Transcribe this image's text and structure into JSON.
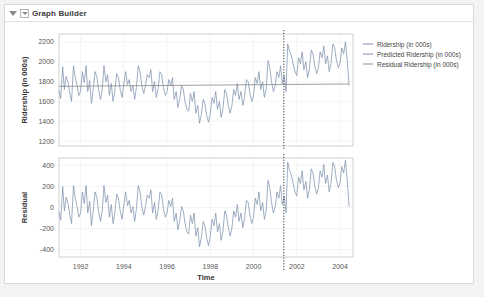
{
  "window": {
    "title": "Graph Builder",
    "collapse_icon": "triangle-down-icon",
    "menu_icon": "triangle-down-boxed-icon"
  },
  "legend": {
    "items": [
      {
        "label": "Ridership (in 000s)",
        "color": "#7f93ad"
      },
      {
        "label": "Predicted Ridership (in 000s)",
        "color": "#7f93ad"
      },
      {
        "label": "Residual Ridership (in 000s)",
        "color": "#7f93ad"
      }
    ]
  },
  "chart_data": {
    "type": "line",
    "title": "",
    "xlabel": "Time",
    "grid": true,
    "legend_position": "right",
    "xlim": [
      1991.0,
      2004.6
    ],
    "xticks": [
      1992,
      1994,
      1996,
      1998,
      2000,
      2002,
      2004
    ],
    "reference_line": {
      "x": 2001.4,
      "style": "dotted",
      "color": "#333333"
    },
    "panels": [
      {
        "name": "ridership-panel",
        "ylabel": "Ridership (in 000s)",
        "ylim": [
          1150,
          2280
        ],
        "yticks": [
          1200,
          1400,
          1600,
          1800,
          2000,
          2200
        ],
        "series": [
          {
            "name": "Ridership (in 000s)",
            "color": "#7f93ad",
            "x": [
              1991.0,
              1991.08,
              1991.17,
              1991.25,
              1991.33,
              1991.42,
              1991.5,
              1991.58,
              1991.67,
              1991.75,
              1991.83,
              1991.92,
              1992.0,
              1992.08,
              1992.17,
              1992.25,
              1992.33,
              1992.42,
              1992.5,
              1992.58,
              1992.67,
              1992.75,
              1992.83,
              1992.92,
              1993.0,
              1993.08,
              1993.17,
              1993.25,
              1993.33,
              1993.42,
              1993.5,
              1993.58,
              1993.67,
              1993.75,
              1993.83,
              1993.92,
              1994.0,
              1994.08,
              1994.17,
              1994.25,
              1994.33,
              1994.42,
              1994.5,
              1994.58,
              1994.67,
              1994.75,
              1994.83,
              1994.92,
              1995.0,
              1995.08,
              1995.17,
              1995.25,
              1995.33,
              1995.42,
              1995.5,
              1995.58,
              1995.67,
              1995.75,
              1995.83,
              1995.92,
              1996.0,
              1996.08,
              1996.17,
              1996.25,
              1996.33,
              1996.42,
              1996.5,
              1996.58,
              1996.67,
              1996.75,
              1996.83,
              1996.92,
              1997.0,
              1997.08,
              1997.17,
              1997.25,
              1997.33,
              1997.42,
              1997.5,
              1997.58,
              1997.67,
              1997.75,
              1997.83,
              1997.92,
              1998.0,
              1998.08,
              1998.17,
              1998.25,
              1998.33,
              1998.42,
              1998.5,
              1998.58,
              1998.67,
              1998.75,
              1998.83,
              1998.92,
              1999.0,
              1999.08,
              1999.17,
              1999.25,
              1999.33,
              1999.42,
              1999.5,
              1999.58,
              1999.67,
              1999.75,
              1999.83,
              1999.92,
              2000.0,
              2000.08,
              2000.17,
              2000.25,
              2000.33,
              2000.42,
              2000.5,
              2000.58,
              2000.67,
              2000.75,
              2000.83,
              2000.92,
              2001.0,
              2001.08,
              2001.17,
              2001.25,
              2001.33,
              2001.42,
              2001.5,
              2001.58,
              2001.67,
              2001.75,
              2001.83,
              2001.92,
              2002.0,
              2002.08,
              2002.17,
              2002.25,
              2002.33,
              2002.42,
              2002.5,
              2002.58,
              2002.67,
              2002.75,
              2002.83,
              2002.92,
              2003.0,
              2003.08,
              2003.17,
              2003.25,
              2003.33,
              2003.42,
              2003.5,
              2003.58,
              2003.67,
              2003.75,
              2003.83,
              2003.92,
              2004.0,
              2004.08,
              2004.17,
              2004.25,
              2004.33,
              2004.42
            ],
            "values": [
              1710,
              1630,
              1950,
              1720,
              1850,
              1790,
              1680,
              1600,
              1960,
              1840,
              1770,
              1660,
              1700,
              1900,
              1790,
              1960,
              1700,
              1810,
              1580,
              1720,
              1900,
              1850,
              1720,
              1620,
              1720,
              1960,
              1800,
              1870,
              1660,
              1780,
              1600,
              1700,
              1880,
              1840,
              1720,
              1640,
              1780,
              1900,
              1770,
              1820,
              1700,
              1760,
              1620,
              1740,
              1960,
              1900,
              1760,
              1680,
              1760,
              1870,
              1840,
              1920,
              1700,
              1800,
              1640,
              1720,
              1900,
              1870,
              1740,
              1660,
              1700,
              1820,
              1760,
              1840,
              1620,
              1700,
              1540,
              1620,
              1760,
              1720,
              1600,
              1520,
              1500,
              1680,
              1600,
              1700,
              1480,
              1560,
              1380,
              1460,
              1620,
              1580,
              1460,
              1390,
              1480,
              1640,
              1580,
              1700,
              1520,
              1600,
              1440,
              1520,
              1720,
              1680,
              1560,
              1480,
              1560,
              1720,
              1660,
              1780,
              1620,
              1700,
              1560,
              1640,
              1820,
              1800,
              1680,
              1600,
              1660,
              1840,
              1780,
              1900,
              1720,
              1800,
              1640,
              1720,
              2010,
              1940,
              1800,
              1700,
              1760,
              1900,
              1840,
              1960,
              1780,
              1860,
              1700,
              2180,
              2100,
              2060,
              1980,
              1900,
              1860,
              2040,
              1980,
              2100,
              1920,
              2000,
              1840,
              1920,
              2120,
              2080,
              1960,
              1880,
              1940,
              2100,
              2040,
              2160,
              1980,
              2060,
              1900,
              1980,
              2180,
              2140,
              2020,
              1940,
              1980,
              2140,
              2080,
              2200,
              2020,
              1760
            ]
          },
          {
            "name": "Predicted Ridership (in 000s)",
            "color": "#7f7f7f",
            "x": [
              1991.0,
              2004.42
            ],
            "values": [
              1752,
              1776
            ]
          }
        ]
      },
      {
        "name": "residual-panel",
        "ylabel": "Residual",
        "ylim": [
          -470,
          470
        ],
        "yticks": [
          -400,
          -200,
          0,
          200,
          400
        ],
        "series": [
          {
            "name": "Residual Ridership (in 000s)",
            "color": "#7f93ad",
            "x": [
              1991.0,
              1991.08,
              1991.17,
              1991.25,
              1991.33,
              1991.42,
              1991.5,
              1991.58,
              1991.67,
              1991.75,
              1991.83,
              1991.92,
              1992.0,
              1992.08,
              1992.17,
              1992.25,
              1992.33,
              1992.42,
              1992.5,
              1992.58,
              1992.67,
              1992.75,
              1992.83,
              1992.92,
              1993.0,
              1993.08,
              1993.17,
              1993.25,
              1993.33,
              1993.42,
              1993.5,
              1993.58,
              1993.67,
              1993.75,
              1993.83,
              1993.92,
              1994.0,
              1994.08,
              1994.17,
              1994.25,
              1994.33,
              1994.42,
              1994.5,
              1994.58,
              1994.67,
              1994.75,
              1994.83,
              1994.92,
              1995.0,
              1995.08,
              1995.17,
              1995.25,
              1995.33,
              1995.42,
              1995.5,
              1995.58,
              1995.67,
              1995.75,
              1995.83,
              1995.92,
              1996.0,
              1996.08,
              1996.17,
              1996.25,
              1996.33,
              1996.42,
              1996.5,
              1996.58,
              1996.67,
              1996.75,
              1996.83,
              1996.92,
              1997.0,
              1997.08,
              1997.17,
              1997.25,
              1997.33,
              1997.42,
              1997.5,
              1997.58,
              1997.67,
              1997.75,
              1997.83,
              1997.92,
              1998.0,
              1998.08,
              1998.17,
              1998.25,
              1998.33,
              1998.42,
              1998.5,
              1998.58,
              1998.67,
              1998.75,
              1998.83,
              1998.92,
              1999.0,
              1999.08,
              1999.17,
              1999.25,
              1999.33,
              1999.42,
              1999.5,
              1999.58,
              1999.67,
              1999.75,
              1999.83,
              1999.92,
              2000.0,
              2000.08,
              2000.17,
              2000.25,
              2000.33,
              2000.42,
              2000.5,
              2000.58,
              2000.67,
              2000.75,
              2000.83,
              2000.92,
              2001.0,
              2001.08,
              2001.17,
              2001.25,
              2001.33,
              2001.42,
              2001.5,
              2001.58,
              2001.67,
              2001.75,
              2001.83,
              2001.92,
              2002.0,
              2002.08,
              2002.17,
              2002.25,
              2002.33,
              2002.42,
              2002.5,
              2002.58,
              2002.67,
              2002.75,
              2002.83,
              2002.92,
              2003.0,
              2003.08,
              2003.17,
              2003.25,
              2003.33,
              2003.42,
              2003.5,
              2003.58,
              2003.67,
              2003.75,
              2003.83,
              2003.92,
              2004.0,
              2004.08,
              2004.17,
              2004.25,
              2004.33,
              2004.42
            ],
            "values": [
              -42,
              -122,
              198,
              -32,
              98,
              38,
              -72,
              -152,
              208,
              88,
              18,
              -92,
              -52,
              148,
              38,
              208,
              -52,
              58,
              -172,
              -32,
              148,
              98,
              -32,
              -132,
              -32,
              208,
              48,
              118,
              -92,
              28,
              -152,
              -52,
              128,
              88,
              -32,
              -112,
              28,
              148,
              18,
              68,
              -52,
              8,
              -132,
              -12,
              208,
              148,
              8,
              -72,
              8,
              118,
              88,
              168,
              -52,
              48,
              -112,
              -32,
              148,
              118,
              -12,
              -92,
              -52,
              68,
              8,
              88,
              -132,
              -52,
              -212,
              -132,
              8,
              -32,
              -152,
              -232,
              -252,
              -72,
              -152,
              -52,
              -272,
              -192,
              -372,
              -292,
              -132,
              -172,
              -292,
              -362,
              -272,
              -112,
              -172,
              -52,
              -232,
              -152,
              -312,
              -232,
              -32,
              -72,
              -192,
              -272,
              -192,
              -32,
              -92,
              28,
              -132,
              -52,
              -192,
              -112,
              68,
              48,
              -72,
              -152,
              -92,
              88,
              28,
              148,
              -32,
              48,
              -112,
              -32,
              258,
              188,
              48,
              -52,
              8,
              148,
              88,
              208,
              28,
              108,
              -52,
              428,
              348,
              308,
              228,
              148,
              108,
              288,
              228,
              348,
              168,
              248,
              88,
              168,
              368,
              328,
              208,
              128,
              188,
              348,
              288,
              408,
              228,
              308,
              148,
              228,
              428,
              388,
              268,
              188,
              228,
              388,
              328,
              448,
              268,
              8
            ]
          }
        ]
      }
    ]
  }
}
